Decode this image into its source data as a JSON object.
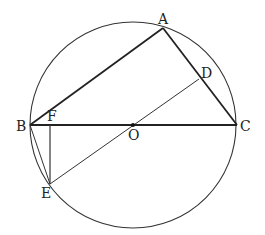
{
  "diagram": {
    "type": "geometry",
    "circle": {
      "center": "O",
      "cx": 133,
      "cy": 125,
      "r": 103
    },
    "points": {
      "A": {
        "label": "A",
        "x": 163,
        "y": 28
      },
      "B": {
        "label": "B",
        "x": 30,
        "y": 125
      },
      "C": {
        "label": "C",
        "x": 237,
        "y": 125
      },
      "D": {
        "label": "D",
        "x": 199,
        "y": 79
      },
      "E": {
        "label": "E",
        "x": 50,
        "y": 184
      },
      "F": {
        "label": "F",
        "x": 50,
        "y": 125
      },
      "O": {
        "label": "O",
        "x": 133,
        "y": 125
      }
    },
    "segments": [
      [
        "A",
        "B"
      ],
      [
        "A",
        "C"
      ],
      [
        "B",
        "C"
      ],
      [
        "D",
        "E"
      ],
      [
        "B",
        "E"
      ],
      [
        "E",
        "F"
      ]
    ],
    "colors": {
      "line": "#222222",
      "background": "#ffffff"
    }
  }
}
